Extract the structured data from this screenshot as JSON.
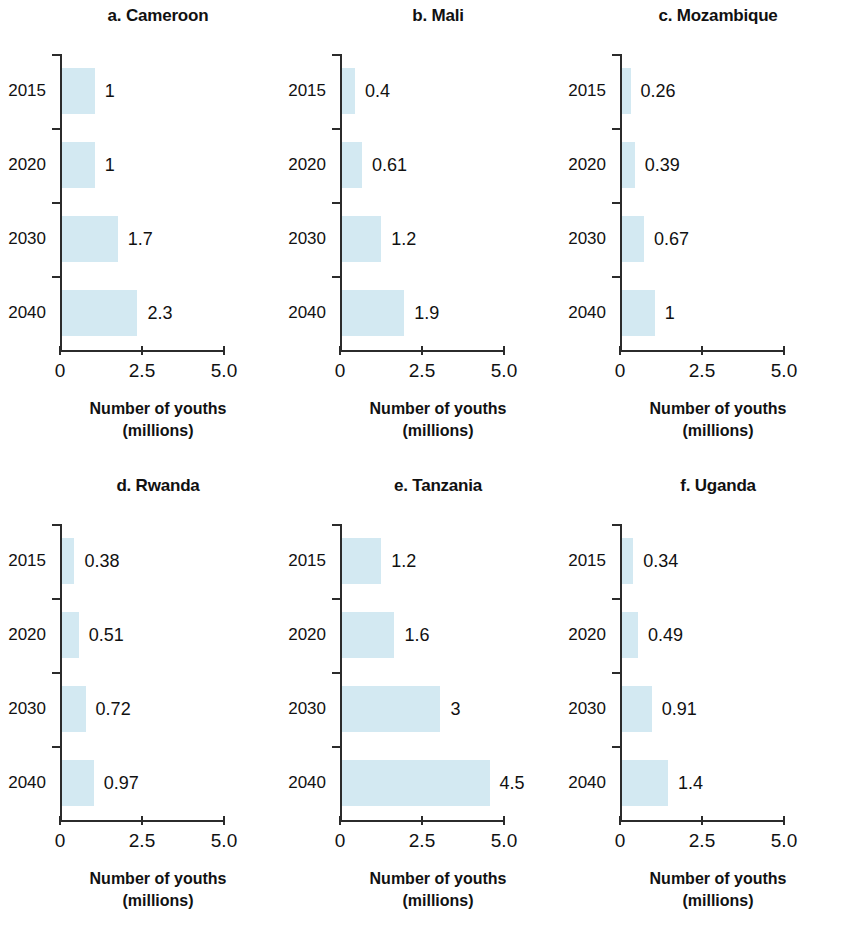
{
  "figure": {
    "width": 841,
    "height": 933,
    "bar_color": "#d3e9f2",
    "axis_color": "#2b2b2b",
    "text_color": "#111111",
    "background": "#ffffff"
  },
  "axis_caption": {
    "line1": "Number of youths",
    "line2": "(millions)"
  },
  "chart_data": {
    "type": "bar",
    "orientation": "horizontal",
    "title": "",
    "xlabel": "Number of youths (millions)",
    "ylabel": "",
    "xlim": [
      0,
      5.0
    ],
    "xticks": [
      0,
      2.5,
      5.0
    ],
    "xtick_labels": [
      "0",
      "2.5",
      "5.0"
    ],
    "categories": [
      "2015",
      "2020",
      "2030",
      "2040"
    ],
    "grid": false,
    "legend": "none",
    "panels": [
      {
        "key": "a",
        "title": "a. Cameroon",
        "categories": [
          "2015",
          "2020",
          "2030",
          "2040"
        ],
        "values": [
          1,
          1,
          1.7,
          2.3
        ],
        "value_labels": [
          "1",
          "1",
          "1.7",
          "2.3"
        ]
      },
      {
        "key": "b",
        "title": "b. Mali",
        "categories": [
          "2015",
          "2020",
          "2030",
          "2040"
        ],
        "values": [
          0.4,
          0.61,
          1.2,
          1.9
        ],
        "value_labels": [
          "0.4",
          "0.61",
          "1.2",
          "1.9"
        ]
      },
      {
        "key": "c",
        "title": "c. Mozambique",
        "categories": [
          "2015",
          "2020",
          "2030",
          "2040"
        ],
        "values": [
          0.26,
          0.39,
          0.67,
          1
        ],
        "value_labels": [
          "0.26",
          "0.39",
          "0.67",
          "1"
        ]
      },
      {
        "key": "d",
        "title": "d. Rwanda",
        "categories": [
          "2015",
          "2020",
          "2030",
          "2040"
        ],
        "values": [
          0.38,
          0.51,
          0.72,
          0.97
        ],
        "value_labels": [
          "0.38",
          "0.51",
          "0.72",
          "0.97"
        ]
      },
      {
        "key": "e",
        "title": "e. Tanzania",
        "categories": [
          "2015",
          "2020",
          "2030",
          "2040"
        ],
        "values": [
          1.2,
          1.6,
          3,
          4.5
        ],
        "value_labels": [
          "1.2",
          "1.6",
          "3",
          "4.5"
        ]
      },
      {
        "key": "f",
        "title": "f. Uganda",
        "categories": [
          "2015",
          "2020",
          "2030",
          "2040"
        ],
        "values": [
          0.34,
          0.49,
          0.91,
          1.4
        ],
        "value_labels": [
          "0.34",
          "0.49",
          "0.91",
          "1.4"
        ]
      }
    ]
  }
}
